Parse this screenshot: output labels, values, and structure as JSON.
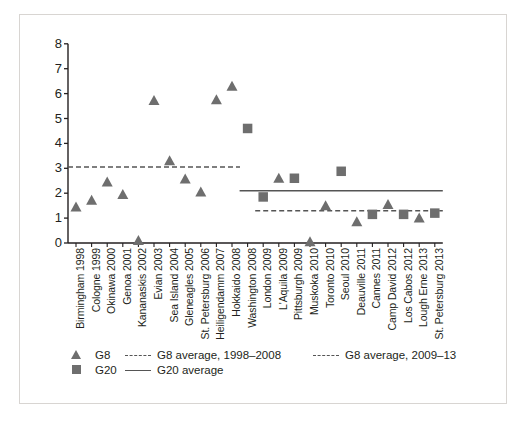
{
  "chart_data": {
    "type": "scatter",
    "title": "",
    "subtitle": "",
    "xlabel": "",
    "ylabel": "",
    "ylim": [
      0,
      8
    ],
    "yticks": [
      0,
      1,
      2,
      3,
      4,
      5,
      6,
      7,
      8
    ],
    "grid": false,
    "legend_position": "bottom-left",
    "categories": [
      "Birmingham 1998",
      "Cologne 1999",
      "Okinawa 2000",
      "Genoa 2001",
      "Kananaskis 2002",
      "Evian 2003",
      "Sea Island 2004",
      "Gleneagles 2005",
      "St. Petersburg 2006",
      "Heiligendamm 2007",
      "Hokkaido 2008",
      "Washington 2008",
      "London 2009",
      "L'Aquila 2009",
      "Pittsburgh 2009",
      "Muskoka 2010",
      "Toronto 2010",
      "Seoul 2010",
      "Deauville 2011",
      "Cannes 2011",
      "Camp David 2012",
      "Los Cabos 2012",
      "Lough Erne 2013",
      "St. Petersburg 2013"
    ],
    "series": [
      {
        "name": "G8",
        "marker": "triangle",
        "color": "#6e6e6e",
        "values": [
          1.45,
          1.72,
          2.45,
          1.95,
          0.1,
          5.72,
          3.3,
          2.57,
          2.05,
          5.75,
          6.3,
          null,
          null,
          2.6,
          null,
          0.05,
          1.5,
          null,
          0.85,
          null,
          1.55,
          null,
          1.0,
          null
        ]
      },
      {
        "name": "G20",
        "marker": "square",
        "color": "#6e6e6e",
        "values": [
          null,
          null,
          null,
          null,
          null,
          null,
          null,
          null,
          null,
          null,
          null,
          4.6,
          1.85,
          null,
          2.6,
          null,
          null,
          2.88,
          null,
          1.15,
          null,
          1.15,
          null,
          1.2
        ]
      }
    ],
    "reference_lines": [
      {
        "name": "G8 average, 1998–2008",
        "style": "dashed",
        "color": "#555555",
        "value": 3.05,
        "x_start_category": "Birmingham 1998",
        "x_end_category": "Hokkaido 2008"
      },
      {
        "name": "G8 average, 2009–13",
        "style": "dashed",
        "color": "#555555",
        "value": 1.3,
        "x_start_category": "London 2009",
        "x_end_category": "St. Petersburg 2013"
      },
      {
        "name": "G20 average",
        "style": "solid",
        "color": "#555555",
        "value": 2.1,
        "x_start_category": "Washington 2008",
        "x_end_category": "St. Petersburg 2013"
      }
    ]
  },
  "axes": {
    "y_tick_labels": [
      "8",
      "7",
      "6",
      "5",
      "4",
      "3",
      "2",
      "1",
      "0"
    ],
    "x_tick_labels": [
      "Birmingham 1998",
      "Cologne 1999",
      "Okinawa 2000",
      "Genoa 2001",
      "Kananaskis 2002",
      "Evian 2003",
      "Sea Island 2004",
      "Gleneagles 2005",
      "St. Petersburg 2006",
      "Heiligendamm 2007",
      "Hokkaido 2008",
      "Washington 2008",
      "London 2009",
      "L'Aquila 2009",
      "Pittsburgh 2009",
      "Muskoka 2010",
      "Toronto 2010",
      "Seoul 2010",
      "Deauville 2011",
      "Cannes 2011",
      "Camp David 2012",
      "Los Cabos 2012",
      "Lough Erne 2013",
      "St. Petersburg 2013"
    ]
  },
  "legend": {
    "g8_marker_label": "G8",
    "g20_marker_label": "G20",
    "g8_avg_early_label": "G8 average, 1998–2008",
    "g8_avg_late_label": "G8 average, 2009–13",
    "g20_avg_label": "G20 average"
  },
  "colors": {
    "marker": "#6e6e6e",
    "line": "#555555",
    "axis": "#231f20",
    "frame": "#d8d5d2",
    "background": "#ffffff"
  }
}
